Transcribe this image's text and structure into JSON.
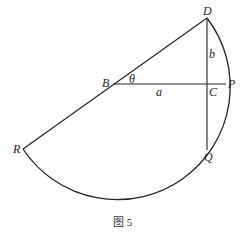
{
  "figure": {
    "caption": "图 5",
    "points": {
      "D": "D",
      "B": "B",
      "C": "C",
      "P": "P",
      "R": "R",
      "Q": "Q"
    },
    "segment_labels": {
      "BC": "a",
      "DC": "b",
      "angle_DBC": "θ"
    },
    "colors": {
      "stroke": "#222222",
      "background": "#ffffff"
    }
  }
}
